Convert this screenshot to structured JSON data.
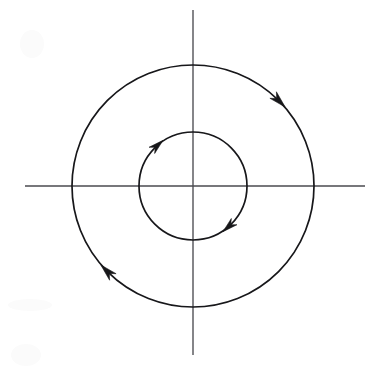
{
  "figure": {
    "background_color": "#ffffff",
    "width": 378,
    "height": 377,
    "axis_color": "#4a4a4f",
    "curve_color": "#17171a",
    "arrow_color": "#17171a"
  },
  "axes": {
    "origin": {
      "x": 193,
      "y": 186
    },
    "horizontal": {
      "name": "x-axis",
      "x_start": 25,
      "x_end": 365,
      "y": 186,
      "label": "",
      "tick_labels": []
    },
    "vertical": {
      "name": "y-axis",
      "y_start": 10,
      "y_end": 355,
      "x": 193,
      "label": "",
      "tick_labels": []
    }
  },
  "chart_data": {
    "type": "line",
    "title": "",
    "subtitle": "",
    "xlabel": "",
    "ylabel": "",
    "xlim": [
      -193,
      185
    ],
    "ylim": [
      -191,
      186
    ],
    "grid": false,
    "legend": null,
    "legend_position": "none",
    "annotations": [],
    "tick_labels": {
      "x": [],
      "y": []
    },
    "series": [
      {
        "name": "outer-orbit",
        "shape": "circle",
        "center": [
          0,
          0
        ],
        "radius": 121,
        "direction": "clockwise",
        "closed": true,
        "arrow_angles_deg": [
          45,
          225
        ],
        "values": []
      },
      {
        "name": "inner-orbit",
        "shape": "circle",
        "center": [
          0,
          0
        ],
        "radius": 54,
        "direction": "clockwise",
        "closed": true,
        "arrow_angles_deg": [
          132,
          312
        ],
        "values": []
      }
    ]
  },
  "arrows": [
    {
      "id": "outer-upper-right",
      "cx": 278,
      "cy": 99,
      "angle_deg": 45,
      "orbit": "outer",
      "direction": "clockwise"
    },
    {
      "id": "outer-lower-left",
      "cx": 108,
      "cy": 272,
      "angle_deg": 225,
      "orbit": "outer",
      "direction": "clockwise"
    },
    {
      "id": "inner-upper-left",
      "cx": 156,
      "cy": 147,
      "angle_deg": 132,
      "orbit": "inner",
      "direction": "clockwise"
    },
    {
      "id": "inner-lower-right",
      "cx": 231,
      "cy": 223,
      "angle_deg": 312,
      "orbit": "inner",
      "direction": "clockwise"
    }
  ]
}
